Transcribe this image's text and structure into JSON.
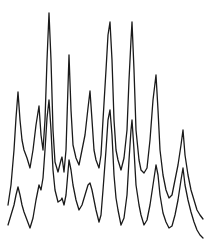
{
  "chart_data": {
    "type": "line",
    "title": "",
    "xlabel": "",
    "ylabel": "",
    "grid": false,
    "legend": null,
    "axes_visible": false,
    "xlim": [
      0,
      211
    ],
    "ylim": [
      0,
      241
    ],
    "y_axis_inverted_pixel_coords": true,
    "line_color": "#1a1a1a",
    "series": [
      {
        "name": "upper-trace",
        "points": [
          [
            8,
            205
          ],
          [
            11,
            185
          ],
          [
            14,
            150
          ],
          [
            16,
            118
          ],
          [
            18,
            92
          ],
          [
            20,
            120
          ],
          [
            22,
            140
          ],
          [
            24,
            150
          ],
          [
            27,
            158
          ],
          [
            30,
            168
          ],
          [
            33,
            150
          ],
          [
            36,
            125
          ],
          [
            39,
            106
          ],
          [
            41,
            135
          ],
          [
            43,
            150
          ],
          [
            45,
            120
          ],
          [
            47,
            60
          ],
          [
            49,
            13
          ],
          [
            51,
            60
          ],
          [
            53,
            130
          ],
          [
            55,
            162
          ],
          [
            58,
            172
          ],
          [
            61,
            160
          ],
          [
            62,
            157
          ],
          [
            64,
            172
          ],
          [
            66,
            150
          ],
          [
            69,
            55
          ],
          [
            71,
            110
          ],
          [
            73,
            145
          ],
          [
            76,
            158
          ],
          [
            79,
            165
          ],
          [
            82,
            150
          ],
          [
            85,
            135
          ],
          [
            88,
            108
          ],
          [
            90,
            91
          ],
          [
            92,
            120
          ],
          [
            94,
            150
          ],
          [
            96,
            160
          ],
          [
            99,
            168
          ],
          [
            101,
            155
          ],
          [
            103,
            120
          ],
          [
            106,
            70
          ],
          [
            108,
            35
          ],
          [
            110,
            22
          ],
          [
            112,
            60
          ],
          [
            114,
            120
          ],
          [
            116,
            150
          ],
          [
            118,
            160
          ],
          [
            121,
            170
          ],
          [
            124,
            158
          ],
          [
            127,
            130
          ],
          [
            129,
            80
          ],
          [
            131,
            40
          ],
          [
            132,
            22
          ],
          [
            134,
            70
          ],
          [
            136,
            130
          ],
          [
            139,
            160
          ],
          [
            141,
            170
          ],
          [
            144,
            173
          ],
          [
            147,
            168
          ],
          [
            150,
            140
          ],
          [
            153,
            100
          ],
          [
            156,
            75
          ],
          [
            158,
            110
          ],
          [
            160,
            150
          ],
          [
            163,
            175
          ],
          [
            166,
            190
          ],
          [
            169,
            198
          ],
          [
            172,
            195
          ],
          [
            175,
            180
          ],
          [
            178,
            165
          ],
          [
            181,
            145
          ],
          [
            183,
            130
          ],
          [
            185,
            155
          ],
          [
            188,
            175
          ],
          [
            191,
            190
          ],
          [
            194,
            200
          ],
          [
            197,
            210
          ],
          [
            200,
            215
          ],
          [
            203,
            219
          ]
        ]
      },
      {
        "name": "lower-trace",
        "points": [
          [
            8,
            225
          ],
          [
            11,
            215
          ],
          [
            14,
            205
          ],
          [
            16,
            195
          ],
          [
            18,
            187
          ],
          [
            20,
            195
          ],
          [
            22,
            205
          ],
          [
            24,
            212
          ],
          [
            27,
            220
          ],
          [
            30,
            228
          ],
          [
            33,
            218
          ],
          [
            36,
            200
          ],
          [
            39,
            185
          ],
          [
            41,
            190
          ],
          [
            43,
            178
          ],
          [
            45,
            150
          ],
          [
            47,
            118
          ],
          [
            49,
            100
          ],
          [
            51,
            130
          ],
          [
            53,
            170
          ],
          [
            55,
            190
          ],
          [
            58,
            202
          ],
          [
            61,
            200
          ],
          [
            62,
            198
          ],
          [
            64,
            205
          ],
          [
            66,
            195
          ],
          [
            69,
            160
          ],
          [
            71,
            170
          ],
          [
            73,
            185
          ],
          [
            76,
            200
          ],
          [
            79,
            210
          ],
          [
            82,
            205
          ],
          [
            85,
            195
          ],
          [
            88,
            185
          ],
          [
            90,
            183
          ],
          [
            92,
            190
          ],
          [
            94,
            200
          ],
          [
            96,
            210
          ],
          [
            99,
            222
          ],
          [
            101,
            215
          ],
          [
            103,
            190
          ],
          [
            106,
            150
          ],
          [
            108,
            120
          ],
          [
            110,
            110
          ],
          [
            112,
            135
          ],
          [
            114,
            175
          ],
          [
            116,
            198
          ],
          [
            118,
            210
          ],
          [
            121,
            225
          ],
          [
            124,
            218
          ],
          [
            127,
            195
          ],
          [
            129,
            160
          ],
          [
            131,
            130
          ],
          [
            132,
            120
          ],
          [
            134,
            150
          ],
          [
            136,
            185
          ],
          [
            139,
            205
          ],
          [
            141,
            215
          ],
          [
            144,
            225
          ],
          [
            147,
            220
          ],
          [
            150,
            205
          ],
          [
            153,
            185
          ],
          [
            156,
            165
          ],
          [
            158,
            175
          ],
          [
            160,
            195
          ],
          [
            163,
            213
          ],
          [
            166,
            222
          ],
          [
            169,
            228
          ],
          [
            172,
            226
          ],
          [
            175,
            215
          ],
          [
            178,
            200
          ],
          [
            181,
            180
          ],
          [
            183,
            168
          ],
          [
            185,
            185
          ],
          [
            188,
            200
          ],
          [
            191,
            212
          ],
          [
            194,
            222
          ],
          [
            197,
            230
          ],
          [
            200,
            235
          ],
          [
            203,
            238
          ]
        ]
      }
    ],
    "peaks_upper_trace_px": [
      {
        "x": 18,
        "y": 92
      },
      {
        "x": 39,
        "y": 106
      },
      {
        "x": 49,
        "y": 13
      },
      {
        "x": 69,
        "y": 55
      },
      {
        "x": 90,
        "y": 91
      },
      {
        "x": 110,
        "y": 22
      },
      {
        "x": 132,
        "y": 22
      },
      {
        "x": 156,
        "y": 75
      },
      {
        "x": 183,
        "y": 130
      }
    ]
  }
}
